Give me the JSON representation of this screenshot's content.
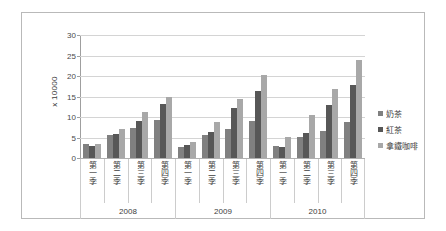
{
  "chart_data": {
    "type": "bar",
    "title": "",
    "subtitle": "",
    "xlabel": "",
    "ylabel": "x 10000",
    "ylim": [
      0,
      30
    ],
    "ytick_step": 5,
    "yticks": [
      "0",
      "5",
      "10",
      "15",
      "20",
      "25",
      "30"
    ],
    "grid": true,
    "legend_position": "right",
    "group_labels": [
      "2008",
      "2009",
      "2010"
    ],
    "categories": [
      "第一季",
      "第二季",
      "第三季",
      "第四季",
      "第一季",
      "第二季",
      "第三季",
      "第四季",
      "第一季",
      "第二季",
      "第三季",
      "第四季"
    ],
    "series": [
      {
        "name": "奶茶",
        "color": "#808080",
        "values": [
          3.3,
          5.7,
          7.3,
          9.2,
          2.8,
          5.5,
          7.1,
          9.0,
          2.9,
          5.1,
          6.6,
          8.7
        ]
      },
      {
        "name": "紅茶",
        "color": "#575757",
        "values": [
          2.9,
          5.9,
          9.1,
          13.2,
          3.1,
          6.4,
          12.2,
          16.4,
          2.8,
          6.0,
          12.9,
          17.8
        ]
      },
      {
        "name": "拿鐵咖啡",
        "color": "#a8a8a8",
        "values": [
          3.5,
          7.1,
          11.3,
          15.0,
          3.8,
          8.7,
          14.3,
          20.3,
          5.2,
          10.5,
          16.9,
          23.8
        ]
      }
    ]
  },
  "legend": {
    "items": [
      {
        "label": "奶茶",
        "color": "#808080"
      },
      {
        "label": "紅茶",
        "color": "#575757"
      },
      {
        "label": "拿鐵咖啡",
        "color": "#a8a8a8"
      }
    ]
  },
  "axis": {
    "y_title": "x 10000"
  }
}
